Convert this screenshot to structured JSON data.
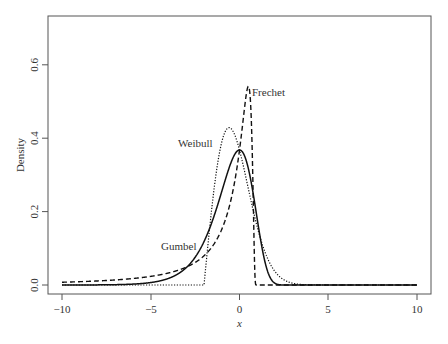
{
  "chart_data": {
    "type": "line",
    "title": "",
    "xlabel": "x",
    "ylabel": "Density",
    "xlim": [
      -10,
      10
    ],
    "ylim": [
      0,
      0.73
    ],
    "xticks": [
      -10,
      -5,
      0,
      5,
      10
    ],
    "xtick_labels": [
      "−10",
      "−5",
      "0",
      "5",
      "10"
    ],
    "yticks": [
      0.0,
      0.2,
      0.4,
      0.6
    ],
    "ytick_labels": [
      "0.0",
      "0.2",
      "0.4",
      "0.6"
    ],
    "grid": false,
    "legend": "none (direct labels)",
    "series": [
      {
        "name": "Gumbel",
        "style": "solid",
        "peak_x": 0.0,
        "peak_y": 0.37,
        "support": "(-inf, inf)",
        "points": [
          [
            -10,
            0.0
          ],
          [
            -5,
            0.007
          ],
          [
            -3,
            0.047
          ],
          [
            -2,
            0.118
          ],
          [
            -1,
            0.254
          ],
          [
            0,
            0.368
          ],
          [
            0.5,
            0.318
          ],
          [
            1,
            0.179
          ],
          [
            1.5,
            0.051
          ],
          [
            2,
            0.0083
          ],
          [
            3,
            0.0
          ],
          [
            10,
            0.0
          ]
        ]
      },
      {
        "name": "Frechet",
        "style": "dashed",
        "peak_x": 0.5,
        "peak_y": 0.54,
        "support": "(-inf, 1)",
        "points": [
          [
            -10,
            0.0075
          ],
          [
            -5,
            0.024
          ],
          [
            -3,
            0.048
          ],
          [
            -2,
            0.079
          ],
          [
            -1,
            0.135
          ],
          [
            0,
            0.25
          ],
          [
            0.5,
            0.541
          ],
          [
            0.8,
            0.17
          ],
          [
            0.95,
            0.0
          ],
          [
            1,
            0.0
          ],
          [
            10,
            0.0
          ]
        ]
      },
      {
        "name": "Weibull",
        "style": "dotted",
        "peak_x": -0.59,
        "peak_y": 0.43,
        "support": "(-2, inf)",
        "points": [
          [
            -10,
            0.0
          ],
          [
            -2,
            0.0
          ],
          [
            -1.5,
            0.234
          ],
          [
            -1,
            0.389
          ],
          [
            -0.59,
            0.429
          ],
          [
            0,
            0.368
          ],
          [
            1,
            0.158
          ],
          [
            2,
            0.037
          ],
          [
            3,
            0.005
          ],
          [
            10,
            0.0
          ]
        ]
      }
    ],
    "annotations": [
      {
        "text": "Gumbel",
        "x": -4.1,
        "y": 0.185
      },
      {
        "text": "Weibull",
        "x": -2.6,
        "y": 0.39
      },
      {
        "text": "Frechet",
        "x": 1.3,
        "y": 0.51
      }
    ]
  },
  "labels": {
    "xlabel": "x",
    "ylabel": "Density",
    "gumbel": "Gumbel",
    "weibull": "Weibull",
    "frechet": "Frechet",
    "xt0": "−10",
    "xt1": "−5",
    "xt2": "0",
    "xt3": "5",
    "xt4": "10",
    "yt0": "0.0",
    "yt1": "0.2",
    "yt2": "0.4",
    "yt3": "0.6"
  }
}
